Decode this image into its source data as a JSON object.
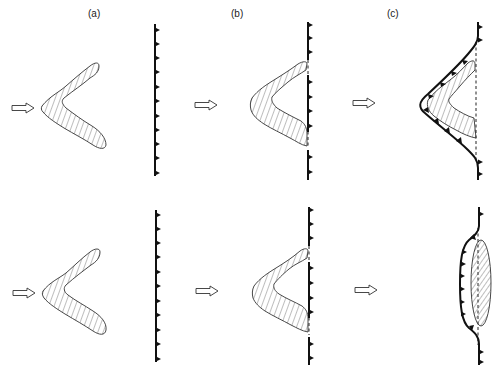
{
  "figure": {
    "panel_labels": [
      "(a)",
      "(b)",
      "(c)"
    ],
    "rows": [
      {
        "name": "top-row",
        "description": "V-shaped indenter with arms, approaching thrust front; in (c) the front wraps around the indenter forming a cusp",
        "outcome": "arcuate-salient"
      },
      {
        "name": "bottom-row",
        "description": "V-shaped indenter approaching thrust front; in (c) the indenter is rotated into an elongate lens and the front bulges gently",
        "outcome": "gentle-bulge"
      }
    ],
    "symbols": {
      "motion_arrow": "hollow-arrow-right-icon",
      "thrust_front": "barbed-line-triangles-icon",
      "former_front": "dashed-line",
      "indenter_fill": "diagonal-hatch"
    },
    "colors": {
      "ink": "#111111",
      "background": "#ffffff"
    }
  }
}
